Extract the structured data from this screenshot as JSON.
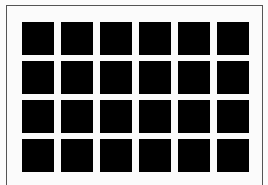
{
  "figure": {
    "rows": 4,
    "columns": 6,
    "square_color": "#000000",
    "background_color": "#fbfbfb",
    "frame_color": "#555555"
  }
}
